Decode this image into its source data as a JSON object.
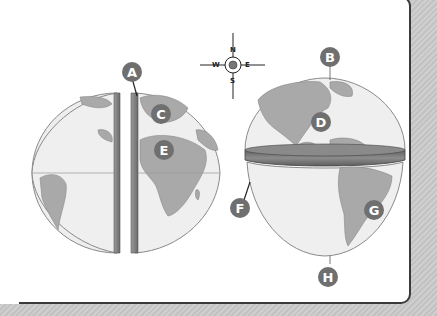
{
  "diagram": {
    "title": "",
    "labels": [
      {
        "id": "A",
        "points_to": "prime meridian cut"
      },
      {
        "id": "B",
        "points_to": "North Pole"
      },
      {
        "id": "C",
        "points_to": "Europe"
      },
      {
        "id": "D",
        "points_to": "North America"
      },
      {
        "id": "E",
        "points_to": "Africa"
      },
      {
        "id": "F",
        "points_to": "equator cut"
      },
      {
        "id": "G",
        "points_to": "South America"
      },
      {
        "id": "H",
        "points_to": "South Pole"
      }
    ],
    "compass": {
      "n": "N",
      "s": "S",
      "e": "E",
      "w": "W"
    },
    "colors": {
      "land": "#a9a9a9",
      "ocean": "#f0f0f0",
      "label_fill": "#6f6f6f",
      "cut_band": "#7a7a7a",
      "border": "#3a3a3a"
    }
  }
}
